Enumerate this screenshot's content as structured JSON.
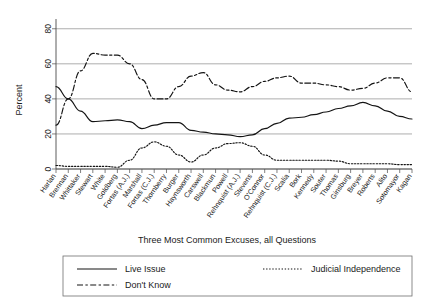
{
  "chart": {
    "type": "line",
    "ylabel": "Percent",
    "xlabel": "Three Most Common Excuses, all Questions"
  },
  "chart_data": {
    "type": "line",
    "title": "",
    "subtitle": "",
    "xlabel": "Three Most Common Excuses, all Questions",
    "ylabel": "Percent",
    "ylim": [
      0,
      85
    ],
    "yticks": [
      0,
      20,
      40,
      60,
      80
    ],
    "ytick_labels": [
      "0",
      "20",
      "40",
      "60",
      "80"
    ],
    "grid": "horizontal",
    "legend_position": "below-plot",
    "categories": [
      "Harlan",
      "Brennan",
      "Whittaker",
      "Stewart",
      "White",
      "Goldberg",
      "Fortas (A.J.)",
      "Marshall",
      "Fortas (C.J.)",
      "Thornberry",
      "Burger",
      "Haynsworth",
      "Carswell",
      "Blackmun",
      "Powell",
      "Rehnquist (A.J.)",
      "Stevens",
      "O'Connor",
      "Rehnquist (C.J.)",
      "Scalia",
      "Bork",
      "Kennedy",
      "Souter",
      "Thomas",
      "Ginsburg",
      "Breyer",
      "Roberts",
      "Alito",
      "Sotomayor",
      "Kagan"
    ],
    "series": [
      {
        "name": "Live Issue",
        "style": "solid",
        "values": [
          47,
          40,
          33,
          27,
          27.5,
          28,
          27,
          23,
          25,
          26.5,
          26.5,
          22,
          21,
          20,
          19.5,
          18.5,
          19.5,
          23,
          26,
          29,
          29.5,
          31,
          32.5,
          34.5,
          36,
          38,
          36,
          33,
          30,
          28.5
        ]
      },
      {
        "name": "Judicial Independence",
        "style": "dotted",
        "values": [
          2,
          1.5,
          1.5,
          1.5,
          1.5,
          1,
          5,
          12,
          15.5,
          13,
          8,
          4,
          8,
          12,
          14.5,
          15,
          13,
          8,
          5,
          5,
          5,
          5,
          5,
          4.5,
          3,
          3,
          3,
          3,
          2.5,
          2.5
        ]
      },
      {
        "name": "Don't Know",
        "style": "dashed",
        "values": [
          25,
          40,
          56,
          66,
          65,
          65,
          60,
          51,
          40,
          40,
          47,
          53,
          55,
          48,
          45,
          44,
          47,
          50,
          52,
          53,
          49,
          49,
          48,
          47,
          45,
          46,
          49,
          52,
          52,
          44
        ]
      }
    ]
  },
  "legend": {
    "entries": [
      {
        "label": "Live Issue",
        "style": "solid"
      },
      {
        "label": "Judicial Independence",
        "style": "dotted"
      },
      {
        "label": "Don't Know",
        "style": "dashed"
      }
    ]
  }
}
